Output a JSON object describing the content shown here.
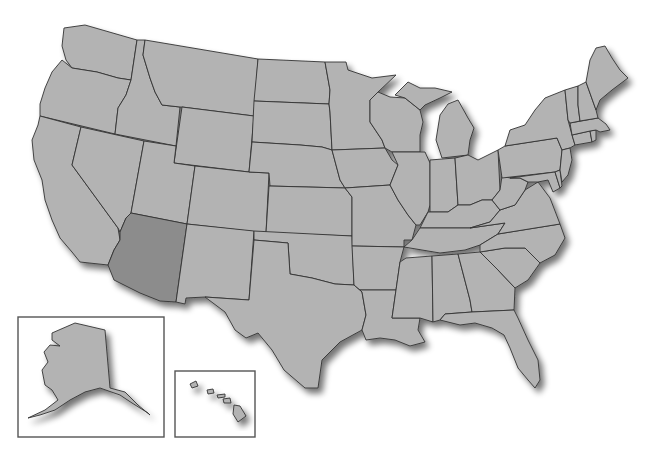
{
  "map": {
    "title": "United States map",
    "highlighted_state": "Arizona",
    "colors": {
      "state_fill": "#b3b3b3",
      "highlight_fill": "#8c8c8c",
      "border": "#333333",
      "background": "#ffffff",
      "inset_frame": "#555555"
    },
    "states": [
      {
        "name": "Washington",
        "highlighted": false
      },
      {
        "name": "Oregon",
        "highlighted": false
      },
      {
        "name": "California",
        "highlighted": false
      },
      {
        "name": "Idaho",
        "highlighted": false
      },
      {
        "name": "Nevada",
        "highlighted": false
      },
      {
        "name": "Montana",
        "highlighted": false
      },
      {
        "name": "Wyoming",
        "highlighted": false
      },
      {
        "name": "Utah",
        "highlighted": false
      },
      {
        "name": "Arizona",
        "highlighted": true
      },
      {
        "name": "Colorado",
        "highlighted": false
      },
      {
        "name": "New Mexico",
        "highlighted": false
      },
      {
        "name": "North Dakota",
        "highlighted": false
      },
      {
        "name": "South Dakota",
        "highlighted": false
      },
      {
        "name": "Nebraska",
        "highlighted": false
      },
      {
        "name": "Kansas",
        "highlighted": false
      },
      {
        "name": "Oklahoma",
        "highlighted": false
      },
      {
        "name": "Texas",
        "highlighted": false
      },
      {
        "name": "Minnesota",
        "highlighted": false
      },
      {
        "name": "Iowa",
        "highlighted": false
      },
      {
        "name": "Missouri",
        "highlighted": false
      },
      {
        "name": "Arkansas",
        "highlighted": false
      },
      {
        "name": "Louisiana",
        "highlighted": false
      },
      {
        "name": "Wisconsin",
        "highlighted": false
      },
      {
        "name": "Illinois",
        "highlighted": false
      },
      {
        "name": "Michigan",
        "highlighted": false
      },
      {
        "name": "Indiana",
        "highlighted": false
      },
      {
        "name": "Ohio",
        "highlighted": false
      },
      {
        "name": "Kentucky",
        "highlighted": false
      },
      {
        "name": "Tennessee",
        "highlighted": false
      },
      {
        "name": "Mississippi",
        "highlighted": false
      },
      {
        "name": "Alabama",
        "highlighted": false
      },
      {
        "name": "Georgia",
        "highlighted": false
      },
      {
        "name": "Florida",
        "highlighted": false
      },
      {
        "name": "South Carolina",
        "highlighted": false
      },
      {
        "name": "North Carolina",
        "highlighted": false
      },
      {
        "name": "Virginia",
        "highlighted": false
      },
      {
        "name": "West Virginia",
        "highlighted": false
      },
      {
        "name": "Pennsylvania",
        "highlighted": false
      },
      {
        "name": "New York",
        "highlighted": false
      },
      {
        "name": "Maryland",
        "highlighted": false
      },
      {
        "name": "Delaware",
        "highlighted": false
      },
      {
        "name": "New Jersey",
        "highlighted": false
      },
      {
        "name": "Connecticut",
        "highlighted": false
      },
      {
        "name": "Rhode Island",
        "highlighted": false
      },
      {
        "name": "Massachusetts",
        "highlighted": false
      },
      {
        "name": "Vermont",
        "highlighted": false
      },
      {
        "name": "New Hampshire",
        "highlighted": false
      },
      {
        "name": "Maine",
        "highlighted": false
      }
    ],
    "insets": [
      {
        "name": "Alaska",
        "highlighted": false
      },
      {
        "name": "Hawaii",
        "highlighted": false
      }
    ]
  }
}
